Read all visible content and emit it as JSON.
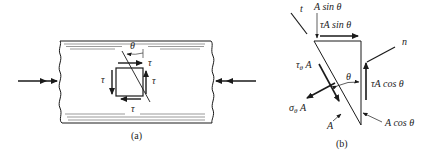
{
  "figure": {
    "panel_a": {
      "caption": "(a)",
      "angle_label": "θ",
      "shear_labels": {
        "top": "τ",
        "left": "τ",
        "right": "τ",
        "bottom": "τ"
      },
      "description": "Rod under axial compression with shear element and inclined plane"
    },
    "panel_b": {
      "caption": "(b)",
      "axis_t": "t",
      "axis_n": "n",
      "label_top_area": "A sin θ",
      "label_top_force": "τA sin θ",
      "label_right_force": "τA cos θ",
      "label_right_area": "A cos θ",
      "label_shear_inclined": "τθ A",
      "label_shear_inclined_main": "τ",
      "label_shear_inclined_sub": "θ",
      "label_shear_inclined_tail": " A",
      "label_normal_main": "σ",
      "label_normal_sub": "θ",
      "label_normal_tail": " A",
      "label_hypotenuse_area": "A",
      "angle_label": "θ"
    },
    "colors": {
      "ink": "#1a1a1a",
      "background": "#ffffff"
    }
  }
}
